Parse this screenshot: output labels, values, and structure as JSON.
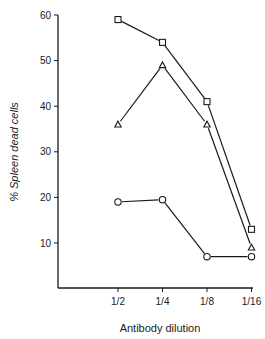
{
  "chart_data": {
    "type": "line",
    "title": "",
    "xlabel": "Antibody dilution",
    "ylabel": "% Spleen dead cells",
    "categories": [
      "1/2",
      "1/4",
      "1/8",
      "1/16"
    ],
    "yticks": [
      10,
      20,
      30,
      40,
      50,
      60
    ],
    "ylim": [
      0,
      60
    ],
    "grid": false,
    "legend": null,
    "series": [
      {
        "name": "square",
        "marker": "square",
        "values": [
          59,
          54,
          41,
          13
        ]
      },
      {
        "name": "triangle",
        "marker": "triangle",
        "values": [
          36,
          49,
          36,
          9
        ]
      },
      {
        "name": "circle",
        "marker": "circle",
        "values": [
          19,
          19.5,
          7,
          7
        ]
      }
    ]
  },
  "colors": {
    "ink": "#1a1a1a",
    "background": "#ffffff"
  }
}
